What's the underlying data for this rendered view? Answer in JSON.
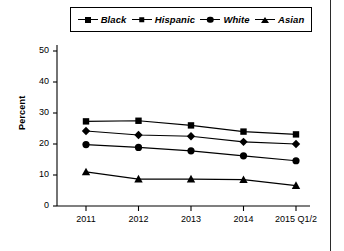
{
  "chart_data": {
    "type": "line",
    "title": "",
    "xlabel": "",
    "ylabel": "Percent",
    "categories": [
      "2011",
      "2012",
      "2013",
      "2014",
      "2015 Q1/2"
    ],
    "ylim": [
      0,
      50
    ],
    "yticks": [
      0,
      10,
      20,
      30,
      40,
      50
    ],
    "grid": false,
    "legend_position": "top",
    "series": [
      {
        "name": "Black",
        "marker": "square",
        "color": "#000000",
        "values": [
          27.3,
          27.5,
          26.0,
          24.0,
          23.1
        ]
      },
      {
        "name": "Hispanic",
        "marker": "diamond",
        "color": "#000000",
        "values": [
          24.2,
          22.9,
          22.5,
          20.7,
          20.0
        ]
      },
      {
        "name": "White",
        "marker": "circle",
        "color": "#000000",
        "values": [
          19.8,
          18.9,
          17.8,
          16.2,
          14.6
        ]
      },
      {
        "name": "Asian",
        "marker": "triangle",
        "color": "#000000",
        "values": [
          11.0,
          8.7,
          8.7,
          8.5,
          6.6
        ]
      }
    ]
  },
  "legend": {
    "items": [
      {
        "label": "Black",
        "marker": "square"
      },
      {
        "label": "Hispanic",
        "marker": "diamond"
      },
      {
        "label": "White",
        "marker": "circle"
      },
      {
        "label": "Asian",
        "marker": "triangle"
      }
    ]
  },
  "axes": {
    "y_title": "Percent",
    "y_labels": [
      "50",
      "40",
      "30",
      "20",
      "10",
      "0"
    ],
    "x_labels": [
      "2011",
      "2012",
      "2013",
      "2014",
      "2015 Q1/2"
    ]
  }
}
